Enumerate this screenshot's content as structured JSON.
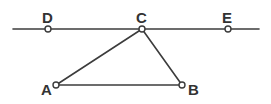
{
  "figure": {
    "background_color": "#ffffff",
    "stroke_color": "#3c3c3c",
    "label_color": "#333333",
    "vertex_fill": "#ffffff",
    "width": 271,
    "height": 104
  },
  "points": {
    "A": {
      "label": "A",
      "x": 56,
      "y": 85,
      "label_x": 41,
      "label_y": 95
    },
    "B": {
      "label": "B",
      "x": 182,
      "y": 85,
      "label_x": 188,
      "label_y": 95
    },
    "C": {
      "label": "C",
      "x": 142,
      "y": 29,
      "label_x": 136,
      "label_y": 23
    },
    "D": {
      "label": "D",
      "x": 48,
      "y": 29,
      "label_x": 42,
      "label_y": 23
    },
    "E": {
      "label": "E",
      "x": 228,
      "y": 29,
      "label_x": 222,
      "label_y": 23
    }
  },
  "segments": [
    {
      "name": "line-DE",
      "from": [
        13,
        29
      ],
      "to": [
        259,
        29
      ]
    },
    {
      "name": "side-AB",
      "from": [
        56,
        85
      ],
      "to": [
        182,
        85
      ]
    },
    {
      "name": "side-AC",
      "from": [
        56,
        85
      ],
      "to": [
        142,
        29
      ]
    },
    {
      "name": "side-BC",
      "from": [
        182,
        85
      ],
      "to": [
        142,
        29
      ]
    }
  ],
  "vertex_marker": {
    "radius": 3,
    "stroke_width": 1.4
  }
}
